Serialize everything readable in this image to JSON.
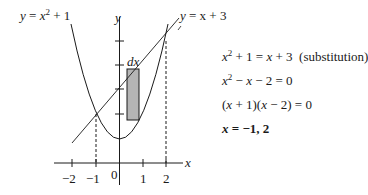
{
  "curves": {
    "parabola_label": "y = x² + 1",
    "parabola_lhs": "y",
    "parabola_rhs_base": "x",
    "parabola_rhs_exp": "2",
    "parabola_rhs_tail": " + 1",
    "line_label_lhs": "y",
    "line_label_rhs": "= x + 3"
  },
  "axes": {
    "x_label": "x",
    "y_label": "y",
    "origin_label": "0",
    "x_ticks": [
      "−2",
      "−1",
      "1",
      "2"
    ]
  },
  "rectangle": {
    "label": "dx",
    "fill": "#b5b5b5"
  },
  "equations": {
    "line1_a": "x",
    "line1_exp": "2",
    "line1_b": " + 1 = ",
    "line1_c": "x",
    "line1_d": " + 3  ",
    "line1_note": "(substitution)",
    "line2_a": "x",
    "line2_exp": "2",
    "line2_b": " − ",
    "line2_c": "x",
    "line2_d": " − 2 = 0",
    "line3_a": "(",
    "line3_b": "x",
    "line3_c": " + 1)(",
    "line3_d": "x",
    "line3_e": " − 2) = 0",
    "line4_a": "x",
    "line4_b": " = −1, 2"
  },
  "colors": {
    "ink": "#1a1a1a",
    "rect_fill": "#b5b5b5"
  }
}
